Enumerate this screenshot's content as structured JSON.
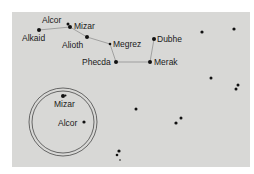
{
  "diagram": {
    "colors": {
      "background": "#d8d8d6",
      "star": "#111111",
      "line": "#777777",
      "circle": "#333333"
    },
    "stars": [
      {
        "name": "Alcor",
        "label": "Alcor",
        "x": 68,
        "y": 24,
        "r": 1.5
      },
      {
        "name": "Mizar",
        "label": "Mizar",
        "x": 70,
        "y": 27,
        "r": 2
      },
      {
        "name": "Alkaid",
        "label": "Alkaid",
        "x": 39,
        "y": 30,
        "r": 2
      },
      {
        "name": "Alioth",
        "label": "Alioth",
        "x": 87,
        "y": 37,
        "r": 2
      },
      {
        "name": "Megrez",
        "label": "Megrez",
        "x": 110,
        "y": 44,
        "r": 1.3
      },
      {
        "name": "Dubhe",
        "label": "Dubhe",
        "x": 154,
        "y": 39,
        "r": 2
      },
      {
        "name": "Phecda",
        "label": "Phecda",
        "x": 116,
        "y": 62,
        "r": 2
      },
      {
        "name": "Merak",
        "label": "Merak",
        "x": 150,
        "y": 62,
        "r": 2
      }
    ],
    "inset": {
      "label": "Mizar and Alcor magnified",
      "cx": 63,
      "cy": 122,
      "r_outer": 34,
      "r_inner": 31,
      "stars": [
        {
          "name": "Mizar",
          "label": "Mizar",
          "x": 63,
          "y": 96,
          "r": 2
        },
        {
          "name": "Alcor",
          "label": "Alcor",
          "x": 84,
          "y": 122,
          "r": 1.6
        }
      ]
    },
    "background_stars": [
      {
        "x": 202,
        "y": 32,
        "r": 1.6
      },
      {
        "x": 234,
        "y": 29,
        "r": 1.6
      },
      {
        "x": 211,
        "y": 78,
        "r": 1.5
      },
      {
        "x": 238,
        "y": 85,
        "r": 1.5
      },
      {
        "x": 236,
        "y": 89,
        "r": 1.5
      },
      {
        "x": 136,
        "y": 109,
        "r": 1.5
      },
      {
        "x": 181,
        "y": 118,
        "r": 1.5
      },
      {
        "x": 176,
        "y": 123,
        "r": 1.6
      },
      {
        "x": 119,
        "y": 151,
        "r": 1.6
      },
      {
        "x": 117,
        "y": 155,
        "r": 1.3
      },
      {
        "x": 120,
        "y": 160,
        "r": 0.8
      }
    ],
    "labels": {
      "alcor": "Alcor",
      "mizar": "Mizar",
      "alkaid": "Alkaid",
      "alioth": "Alioth",
      "megrez": "Megrez",
      "dubhe": "Dubhe",
      "phecda": "Phecda",
      "merak": "Merak",
      "inset_mizar": "Mizar",
      "inset_alcor": "Alcor"
    }
  }
}
